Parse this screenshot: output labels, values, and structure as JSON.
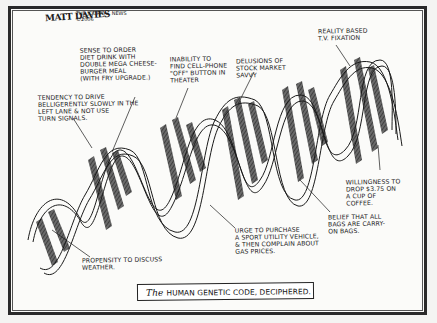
{
  "cartoon": {
    "signature": "MATT DAVIES",
    "publication": "THE JOURNAL NEWS\n©2006",
    "caption": {
      "article": "The",
      "text": "HUMAN GENETIC CODE, DECIPHERED."
    },
    "annotations": [
      {
        "id": "diet-drink",
        "text": "SENSE TO ORDER\nDIET DRINK WITH\nDOUBLE MEGA CHEESE-\nBURGER MEAL\n(WITH FRY UPGRADE.)"
      },
      {
        "id": "drive-slowly",
        "text": "TENDENCY TO DRIVE\nBELLIGERENTLY SLOWLY IN THE\nLEFT LANE & NOT USE\nTURN SIGNALS."
      },
      {
        "id": "cell-phone",
        "text": "INABILITY TO\nFIND CELL-PHONE\n\"OFF\" BUTTON IN\nTHEATER"
      },
      {
        "id": "stock-market",
        "text": "DELUSIONS OF\nSTOCK MARKET\nSAVVY"
      },
      {
        "id": "reality-tv",
        "text": "REALITY BASED\nT.V. FIXATION"
      },
      {
        "id": "coffee",
        "text": "WILLINGNESS TO\nDROP $3.75 ON\nA CUP OF\nCOFFEE."
      },
      {
        "id": "carry-on",
        "text": "BELIEF THAT ALL\nBAGS ARE CARRY-\nON BAGS."
      },
      {
        "id": "suv",
        "text": "URGE TO PURCHASE\nA SPORT UTILITY VEHICLE,\n& THEN COMPLAIN ABOUT\nGAS PRICES."
      },
      {
        "id": "weather",
        "text": "PROPENSITY TO DISCUSS\nWEATHER."
      }
    ]
  },
  "colors": {
    "ink": "#1a1a1a",
    "paper": "#fbfbf9",
    "stripe": "#4a4a4a"
  }
}
